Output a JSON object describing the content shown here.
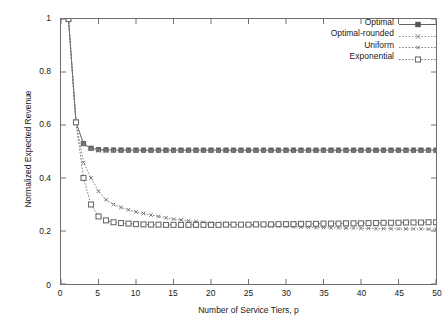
{
  "chart_data": {
    "type": "line",
    "title": "",
    "xlabel": "Number of Service Tiers, p",
    "ylabel": "Normalized Expected Revenue",
    "xlim": [
      0,
      50
    ],
    "ylim": [
      0,
      1
    ],
    "xticks": [
      0,
      5,
      10,
      15,
      20,
      25,
      30,
      35,
      40,
      45,
      50
    ],
    "ytick_labels": [
      "0",
      "0.2",
      "0.4",
      "0.6",
      "0.8",
      "1"
    ],
    "yticks": [
      0,
      0.2,
      0.4,
      0.6,
      0.8,
      1
    ],
    "grid": false,
    "legend_position": "top-right",
    "x": [
      1,
      2,
      3,
      4,
      5,
      6,
      7,
      8,
      9,
      10,
      11,
      12,
      13,
      14,
      15,
      16,
      17,
      18,
      19,
      20,
      21,
      22,
      23,
      24,
      25,
      26,
      27,
      28,
      29,
      30,
      31,
      32,
      33,
      34,
      35,
      36,
      37,
      38,
      39,
      40,
      41,
      42,
      43,
      44,
      45,
      46,
      47,
      48,
      49,
      50
    ],
    "series": [
      {
        "name": "Optimal",
        "color": "#555555",
        "marker": "filled-square",
        "line": "solid",
        "values": [
          1.0,
          0.61,
          0.53,
          0.512,
          0.507,
          0.506,
          0.5055,
          0.5053,
          0.5052,
          0.5051,
          0.5051,
          0.505,
          0.505,
          0.505,
          0.505,
          0.505,
          0.505,
          0.505,
          0.505,
          0.505,
          0.505,
          0.505,
          0.505,
          0.505,
          0.505,
          0.505,
          0.505,
          0.505,
          0.505,
          0.505,
          0.505,
          0.505,
          0.505,
          0.505,
          0.505,
          0.505,
          0.505,
          0.505,
          0.505,
          0.505,
          0.505,
          0.505,
          0.505,
          0.505,
          0.505,
          0.505,
          0.505,
          0.505,
          0.505,
          0.505
        ]
      },
      {
        "name": "Optimal-rounded",
        "color": "#8a8a8a",
        "marker": "x",
        "line": "dotted",
        "values": [
          1.0,
          0.61,
          0.528,
          0.51,
          0.505,
          0.504,
          0.5038,
          0.5036,
          0.5035,
          0.5034,
          0.5034,
          0.5033,
          0.5033,
          0.5033,
          0.5033,
          0.5033,
          0.5033,
          0.5033,
          0.5033,
          0.5033,
          0.5033,
          0.5033,
          0.5033,
          0.5033,
          0.5033,
          0.5033,
          0.5033,
          0.5033,
          0.5033,
          0.5033,
          0.5033,
          0.5033,
          0.5033,
          0.5033,
          0.5033,
          0.5033,
          0.5033,
          0.5033,
          0.5033,
          0.5033,
          0.5033,
          0.5033,
          0.5033,
          0.5033,
          0.5033,
          0.5033,
          0.5033,
          0.5033,
          0.5033,
          0.5033
        ]
      },
      {
        "name": "Uniform",
        "color": "#777777",
        "marker": "small-x",
        "line": "dotted",
        "values": [
          1.0,
          0.61,
          0.458,
          0.4,
          0.35,
          0.318,
          0.3,
          0.289,
          0.28,
          0.272,
          0.266,
          0.26,
          0.255,
          0.25,
          0.245,
          0.242,
          0.239,
          0.236,
          0.233,
          0.23,
          0.228,
          0.226,
          0.225,
          0.223,
          0.222,
          0.221,
          0.22,
          0.219,
          0.218,
          0.217,
          0.216,
          0.215,
          0.214,
          0.213,
          0.213,
          0.212,
          0.212,
          0.211,
          0.211,
          0.21,
          0.21,
          0.209,
          0.209,
          0.209,
          0.208,
          0.208,
          0.208,
          0.208,
          0.207,
          0.207
        ]
      },
      {
        "name": "Exponential",
        "color": "#6b6b6b",
        "marker": "open-square",
        "line": "dotted",
        "values": [
          1.0,
          0.61,
          0.4,
          0.3,
          0.255,
          0.24,
          0.233,
          0.23,
          0.228,
          0.226,
          0.225,
          0.224,
          0.224,
          0.223,
          0.223,
          0.223,
          0.223,
          0.223,
          0.223,
          0.223,
          0.223,
          0.224,
          0.224,
          0.224,
          0.224,
          0.225,
          0.225,
          0.225,
          0.226,
          0.226,
          0.226,
          0.227,
          0.227,
          0.227,
          0.228,
          0.228,
          0.228,
          0.229,
          0.229,
          0.229,
          0.23,
          0.23,
          0.231,
          0.231,
          0.231,
          0.232,
          0.232,
          0.232,
          0.233,
          0.233
        ]
      }
    ]
  },
  "legend": {
    "entries": [
      {
        "label": "Optimal"
      },
      {
        "label": "Optimal-rounded"
      },
      {
        "label": "Uniform"
      },
      {
        "label": "Exponential"
      }
    ]
  }
}
